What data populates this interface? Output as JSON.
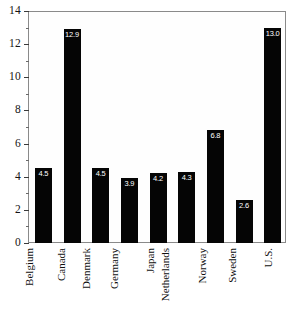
{
  "chart_data": {
    "type": "bar",
    "title": "",
    "subtitle": "",
    "xlabel": "",
    "ylabel": "",
    "categories": [
      "Belgium",
      "Canada",
      "Denmark",
      "Germany",
      "Japan",
      "Netherlands",
      "Norway",
      "Sweden",
      "U.S."
    ],
    "values": [
      4.5,
      12.9,
      4.5,
      3.9,
      4.2,
      4.3,
      6.8,
      2.6,
      13.0
    ],
    "value_labels": [
      "4.5",
      "12.9",
      "4.5",
      "3.9",
      "4.2",
      "4.3",
      "6.8",
      "2.6",
      "13.0"
    ],
    "ylim": [
      0,
      14
    ],
    "y_major_ticks": [
      0,
      2,
      4,
      6,
      8,
      10,
      12,
      14
    ],
    "y_major_tick_labels": [
      "0",
      "2",
      "4",
      "6",
      "8",
      "10",
      "12",
      "14"
    ],
    "y_minor_ticks": [
      1,
      3,
      5,
      7,
      9,
      11,
      13
    ],
    "grid": false,
    "legend": false,
    "legend_position": "none",
    "bar_color": "#050505",
    "value_label_color": "#ffffff",
    "axis_color": "#8a8a8a",
    "background_color": "#ffffff"
  }
}
